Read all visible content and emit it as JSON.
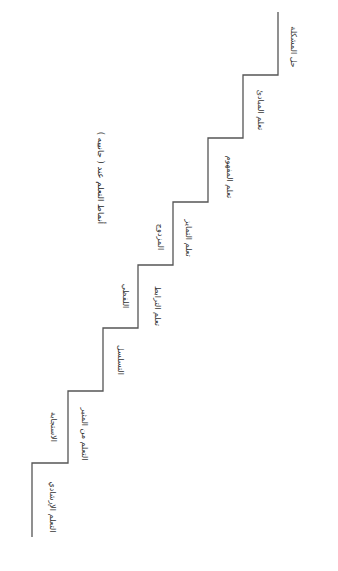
{
  "diagram": {
    "title": "أنماط التعلم عند ( جانييه )",
    "type": "staircase",
    "line_color": "#555555",
    "steps": [
      {
        "level": 8,
        "label": "حل المشكلة"
      },
      {
        "level": 7,
        "label": "تعلم المبادئ"
      },
      {
        "level": 6,
        "label": "تعلم المفهوم"
      },
      {
        "level": 5,
        "label": "تعلم التمايز",
        "label_upper": "المزدوج"
      },
      {
        "level": 4,
        "label": "تعلم الترابط",
        "label_upper": "اللفظي"
      },
      {
        "level": 3,
        "label_upper": "التسلسل"
      },
      {
        "level": 2,
        "label": "التعلم من المثير",
        "label_upper": "الاستجابة"
      },
      {
        "level": 1,
        "label": "التعلم الإرشادي"
      }
    ]
  }
}
